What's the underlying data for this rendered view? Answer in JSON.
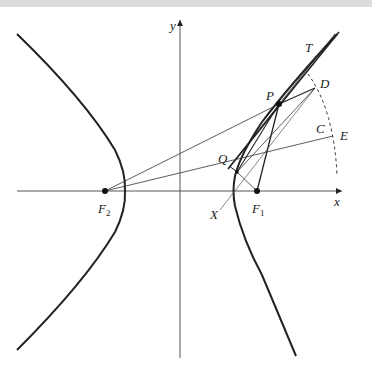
{
  "diagram": {
    "title": "",
    "axes": {
      "x_label": "x",
      "y_label": "y"
    },
    "points": {
      "F1": {
        "label": "F",
        "sub": "1"
      },
      "F2": {
        "label": "F",
        "sub": "2"
      },
      "P": {
        "label": "P"
      },
      "Q": {
        "label": "Q"
      },
      "D": {
        "label": "D"
      },
      "E": {
        "label": "E"
      },
      "C": {
        "label": "C"
      },
      "T": {
        "label": "T"
      },
      "X": {
        "label": "X"
      }
    },
    "colors": {
      "stroke": "#222222",
      "thin": "#444444",
      "topbar": "#dcdcdc"
    }
  }
}
